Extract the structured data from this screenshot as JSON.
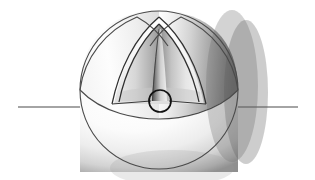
{
  "figure": {
    "background_color": "#ffffff",
    "width": 315,
    "height": 180,
    "stroke_color": "#3a3a3a",
    "stroke_color_dark": "#141414",
    "sphere": {
      "name": "sphere-body",
      "center_x": 159,
      "center_y": 90,
      "radius": 79,
      "outline_color": "#4a4a4a",
      "outline_width": 1.1,
      "highlight_color": "#ffffff",
      "midtone_color": "#d8d8d8",
      "shadow_color": "#6e6e6e"
    },
    "upper_hemisphere": {
      "name": "upper-hemisphere",
      "light_color": "#fcfcfc",
      "mid_color": "#cfcfcf",
      "dark_color": "#6a6a6a"
    },
    "lower_hemisphere": {
      "name": "lower-hemisphere",
      "light_color": "#ffffff",
      "mid_color": "#ebebeb",
      "dark_color": "#8d8d8d"
    },
    "cutaway": {
      "name": "octant-cutaway",
      "apex_x": 159,
      "apex_y": 24,
      "base_y": 101,
      "left_x": 118,
      "right_x": 200,
      "rim_color": "#ffffff",
      "inner_light": "#f4f4f4",
      "inner_mid": "#b4b4b4",
      "inner_dark": "#5c5c5c"
    },
    "spine": {
      "name": "wedge-spine",
      "top_y": 30,
      "bottom_y": 101,
      "half_width_top": 1.0,
      "half_width_bottom": 7.5,
      "light_color": "#f2f2f2",
      "dark_color": "#4f4f4f"
    },
    "core_circle": {
      "name": "core-circle",
      "center_x": 160,
      "center_y": 101,
      "radius": 11,
      "stroke_color": "#111111",
      "stroke_width": 1.7,
      "fill": "none"
    },
    "axis_line": {
      "name": "horizontal-axis-line",
      "x_start": 18,
      "x_end": 298,
      "y": 107,
      "color": "#4a4a4a",
      "width": 1.1
    },
    "equator": {
      "name": "equator-arc",
      "color": "#4a4a4a",
      "width": 1.1
    },
    "meridian_left": {
      "name": "meridian-arc-left",
      "color": "#4a4a4a",
      "width": 1.1
    },
    "meridian_right": {
      "name": "meridian-arc-right",
      "color": "#4a4a4a",
      "width": 1.1
    },
    "labels": {
      "caption": ""
    }
  }
}
